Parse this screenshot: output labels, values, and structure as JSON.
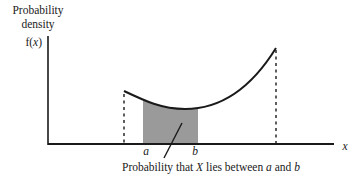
{
  "diagram": {
    "ylabel_line1": "Probability",
    "ylabel_line2": "density",
    "func_label_prefix": "f(",
    "func_label_var": "x",
    "func_label_suffix": ")",
    "xlabel": "x",
    "bound_a": "a",
    "bound_b": "b",
    "caption": {
      "part1": "Probability that ",
      "var": "X",
      "part2": " lies between ",
      "a": "a",
      "part3": " and ",
      "b": "b"
    },
    "colors": {
      "line": "#1a1a1a",
      "shade": "#9a9a9a"
    }
  }
}
